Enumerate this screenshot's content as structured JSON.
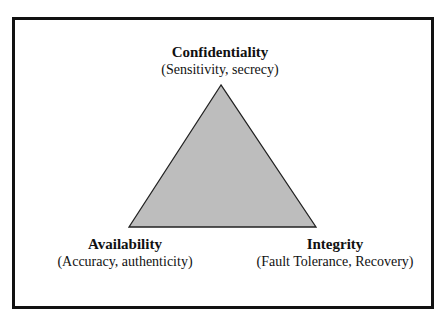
{
  "diagram": {
    "shape": "triangle",
    "fill_color": "#bdbdbd",
    "stroke_color": "#222222",
    "frame_color": "#111111",
    "vertices": {
      "top": {
        "title": "Confidentiality",
        "subtitle": "(Sensitivity, secrecy)"
      },
      "bottom_left": {
        "title": "Availability",
        "subtitle": "(Accuracy, authenticity)"
      },
      "bottom_right": {
        "title": "Integrity",
        "subtitle": "(Fault Tolerance, Recovery)"
      }
    }
  }
}
